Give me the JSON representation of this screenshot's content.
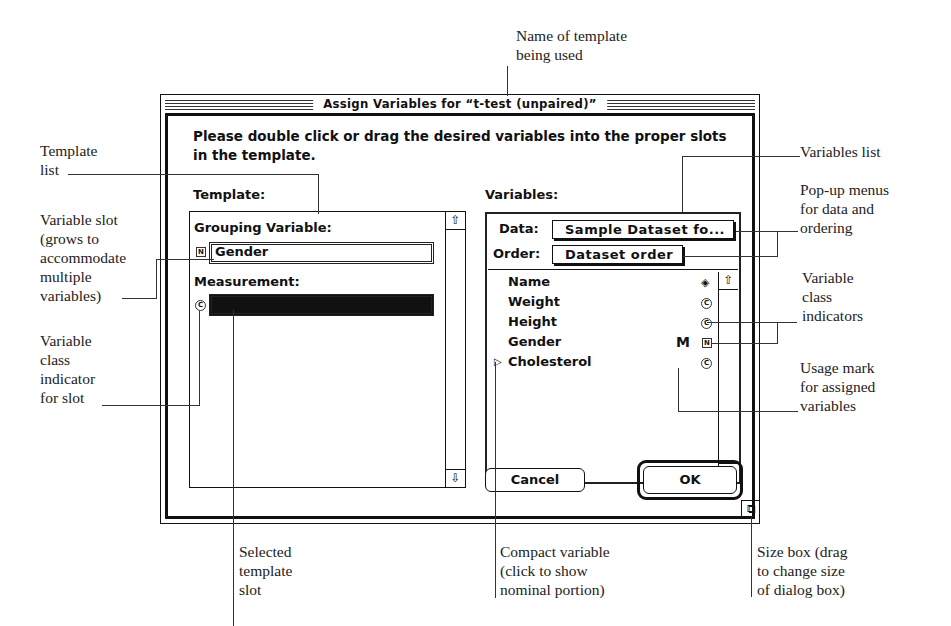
{
  "dialog": {
    "title": "Assign Variables for “t-test (unpaired)”",
    "instructions": "Please double click or drag the desired variables into the proper slots in the template."
  },
  "template": {
    "label": "Template:",
    "slots": [
      {
        "label": "Grouping Variable:",
        "class_icon": "N",
        "value": "Gender",
        "selected": false
      },
      {
        "label": "Measurement:",
        "class_icon": "C",
        "value": "",
        "selected": true
      }
    ]
  },
  "variables": {
    "label": "Variables:",
    "data_label": "Data:",
    "data_value": "Sample Dataset fo...",
    "order_label": "Order:",
    "order_value": "Dataset order",
    "items": [
      {
        "name": "Name",
        "usage": "",
        "class_icon": "◈",
        "compact": false
      },
      {
        "name": "Weight",
        "usage": "",
        "class_icon": "C",
        "compact": false
      },
      {
        "name": "Height",
        "usage": "",
        "class_icon": "C",
        "compact": false
      },
      {
        "name": "Gender",
        "usage": "M",
        "class_icon": "N",
        "compact": false
      },
      {
        "name": "Cholesterol",
        "usage": "",
        "class_icon": "C",
        "compact": true
      }
    ]
  },
  "buttons": {
    "cancel": "Cancel",
    "ok": "OK"
  },
  "icons": {
    "scroll_up": "⇧",
    "scroll_down": "⇩",
    "compact_triangle": "▷",
    "size_box": "⧉"
  },
  "annotations": {
    "template_name": "Name of template\nbeing used",
    "template_list": "Template\nlist",
    "variable_slot": "Variable slot\n(grows to\naccommodate\nmultiple\nvariables)",
    "class_indicator_slot": "Variable\nclass\nindicator\nfor slot",
    "variables_list": "Variables list",
    "popup_menus": "Pop-up menus\nfor data and\nordering",
    "class_indicators": "Variable\nclass\nindicators",
    "usage_mark": "Usage mark\nfor assigned\nvariables",
    "selected_slot": "Selected\ntemplate\nslot",
    "compact_variable": "Compact variable\n(click to show\nnominal portion)",
    "size_box": "Size box (drag\nto change size\nof dialog box)"
  }
}
